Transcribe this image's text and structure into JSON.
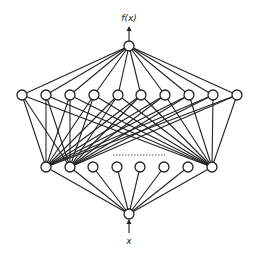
{
  "diagram": {
    "type": "neural-network",
    "output_label": "f(x)",
    "input_label": "x",
    "output_node": {
      "x": 129,
      "y": 46
    },
    "input_node": {
      "x": 129,
      "y": 214
    },
    "hidden_layer_top": {
      "y": 95,
      "xs": [
        22,
        46,
        70,
        94,
        118,
        141,
        165,
        189,
        213,
        237
      ]
    },
    "hidden_layer_bottom": {
      "y": 167,
      "xs": [
        46,
        70,
        93,
        117,
        140,
        164,
        188,
        212
      ]
    },
    "top_to_bottom_connected_indices": [
      0,
      1,
      7
    ],
    "omitted_connections_marker": {
      "x1": 113,
      "x2": 165,
      "y": 155
    },
    "colors": {
      "line": "#222222",
      "background": "#ffffff"
    }
  }
}
